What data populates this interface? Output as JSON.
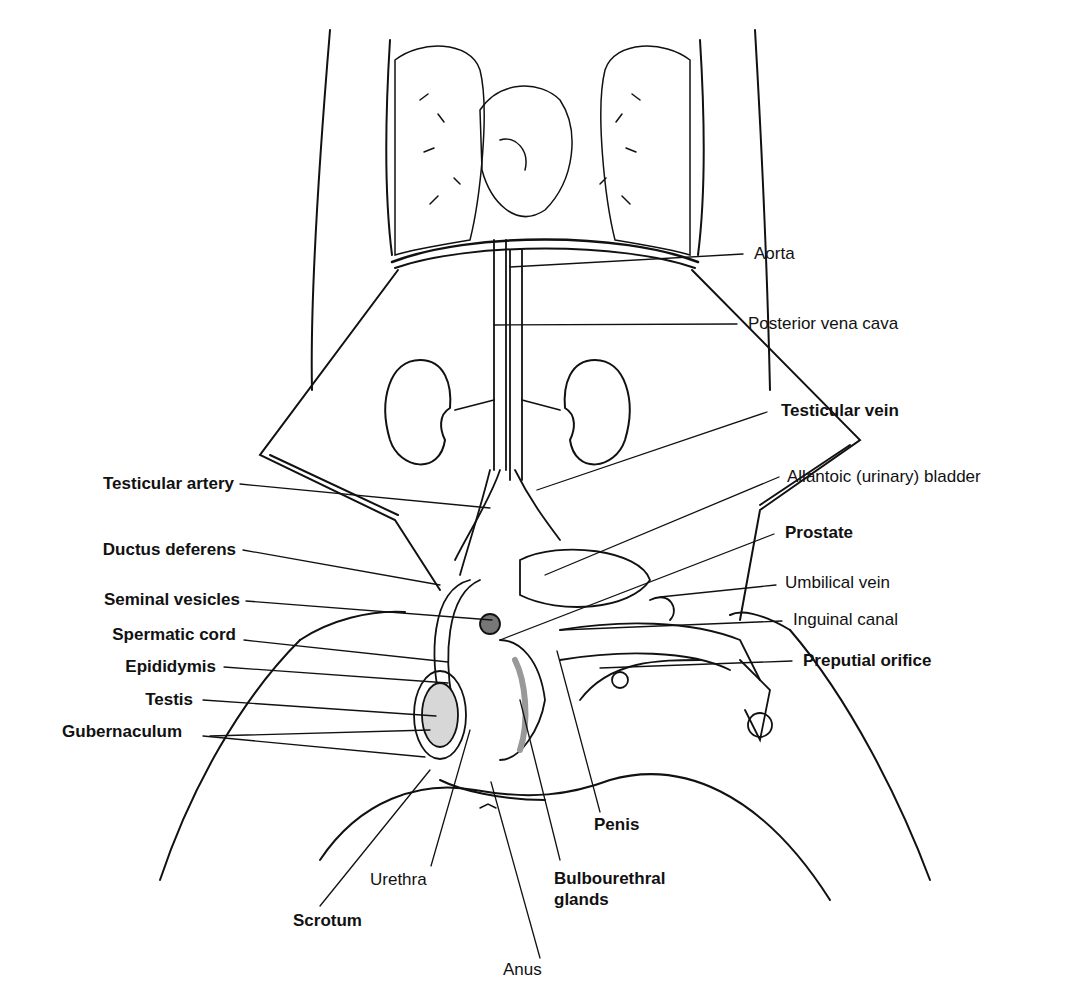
{
  "diagram": {
    "labels": {
      "aorta": "Aorta",
      "posterior_vena_cava": "Posterior vena cava",
      "testicular_vein": "Testicular vein",
      "allantoic_bladder": "Allantoic (urinary) bladder",
      "testicular_artery": "Testicular artery",
      "prostate": "Prostate",
      "ductus_deferens": "Ductus deferens",
      "umbilical_vein": "Umbilical vein",
      "seminal_vesicles": "Seminal vesicles",
      "inguinal_canal": "Inguinal canal",
      "spermatic_cord": "Spermatic cord",
      "preputial_orifice": "Preputial orifice",
      "epididymis": "Epididymis",
      "testis": "Testis",
      "gubernaculum": "Gubernaculum",
      "penis": "Penis",
      "urethra": "Urethra",
      "bulbourethral_glands_line1": "Bulbourethral",
      "bulbourethral_glands_line2": "glands",
      "scrotum": "Scrotum",
      "anus": "Anus"
    }
  }
}
